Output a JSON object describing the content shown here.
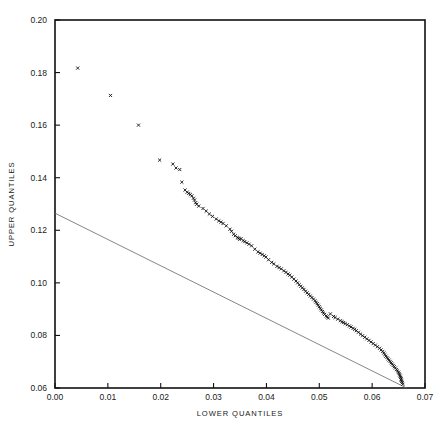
{
  "figure": {
    "background_color": "#ffffff",
    "width": 444,
    "height": 427
  },
  "chart_data": {
    "type": "scatter",
    "title": "",
    "subtitle": "",
    "xlabel": "LOWER QUANTILES",
    "ylabel": "UPPER QUANTILES",
    "xlim": [
      0.0,
      0.07
    ],
    "ylim": [
      0.06,
      0.2
    ],
    "xticks": [
      0.0,
      0.01,
      0.02,
      0.03,
      0.04,
      0.05,
      0.06,
      0.07
    ],
    "xtick_labels": [
      "0.00",
      "0.01",
      "0.02",
      "0.03",
      "0.04",
      "0.05",
      "0.06",
      "0.07"
    ],
    "yticks": [
      0.06,
      0.08,
      0.1,
      0.12,
      0.14,
      0.16,
      0.18,
      0.2
    ],
    "ytick_labels": [
      "0.06",
      "0.08",
      "0.10",
      "0.12",
      "0.14",
      "0.16",
      "0.18",
      "0.20"
    ],
    "grid": false,
    "legend": null,
    "marker_symbol": "x",
    "marker_color": "#111111",
    "marker_size": 3.1,
    "frame_color": "#111111",
    "reference_line": {
      "name": "reference-line",
      "color": "#666666",
      "x": [
        0.0,
        0.0665
      ],
      "y": [
        0.1265,
        0.06
      ]
    },
    "series": [
      {
        "name": "quantile-pairs",
        "points": [
          [
            0.0043,
            0.1817
          ],
          [
            0.0105,
            0.1713
          ],
          [
            0.0158,
            0.16
          ],
          [
            0.0198,
            0.1467
          ],
          [
            0.0223,
            0.1452
          ],
          [
            0.0229,
            0.1437
          ],
          [
            0.0236,
            0.1431
          ],
          [
            0.024,
            0.1383
          ],
          [
            0.0246,
            0.1353
          ],
          [
            0.025,
            0.1345
          ],
          [
            0.0253,
            0.134
          ],
          [
            0.0256,
            0.1336
          ],
          [
            0.0259,
            0.1331
          ],
          [
            0.0266,
            0.1305
          ],
          [
            0.028,
            0.1283
          ],
          [
            0.0292,
            0.1262
          ],
          [
            0.0305,
            0.1243
          ],
          [
            0.031,
            0.1236
          ],
          [
            0.0314,
            0.1231
          ],
          [
            0.0318,
            0.1226
          ],
          [
            0.0324,
            0.1217
          ],
          [
            0.0331,
            0.1204
          ],
          [
            0.0338,
            0.1185
          ],
          [
            0.0352,
            0.1168
          ],
          [
            0.0356,
            0.1161
          ],
          [
            0.0359,
            0.1157
          ],
          [
            0.0363,
            0.1152
          ],
          [
            0.0367,
            0.1147
          ],
          [
            0.0372,
            0.1141
          ],
          [
            0.0378,
            0.1128
          ],
          [
            0.0384,
            0.1118
          ],
          [
            0.0392,
            0.1108
          ],
          [
            0.0399,
            0.1098
          ],
          [
            0.0404,
            0.1088
          ],
          [
            0.041,
            0.1078
          ],
          [
            0.0414,
            0.1072
          ],
          [
            0.042,
            0.1063
          ],
          [
            0.0428,
            0.1053
          ],
          [
            0.0433,
            0.1046
          ],
          [
            0.0437,
            0.104
          ],
          [
            0.0441,
            0.1034
          ],
          [
            0.0444,
            0.1029
          ],
          [
            0.0448,
            0.1022
          ],
          [
            0.0452,
            0.1014
          ],
          [
            0.0456,
            0.1007
          ],
          [
            0.0459,
            0.1
          ],
          [
            0.0462,
            0.0993
          ],
          [
            0.0465,
            0.0987
          ],
          [
            0.0468,
            0.0981
          ],
          [
            0.0471,
            0.0975
          ],
          [
            0.0474,
            0.0968
          ],
          [
            0.0477,
            0.0962
          ],
          [
            0.048,
            0.0956
          ],
          [
            0.0483,
            0.095
          ],
          [
            0.0486,
            0.0944
          ],
          [
            0.0489,
            0.0938
          ],
          [
            0.0492,
            0.0932
          ],
          [
            0.0494,
            0.0926
          ],
          [
            0.0496,
            0.0921
          ],
          [
            0.0498,
            0.0915
          ],
          [
            0.05,
            0.0909
          ],
          [
            0.0502,
            0.0903
          ],
          [
            0.0504,
            0.0897
          ],
          [
            0.0506,
            0.0891
          ],
          [
            0.0508,
            0.0885
          ],
          [
            0.051,
            0.088
          ],
          [
            0.0513,
            0.0874
          ],
          [
            0.0521,
            0.0882
          ],
          [
            0.0535,
            0.0862
          ],
          [
            0.0546,
            0.0849
          ],
          [
            0.0549,
            0.0845
          ],
          [
            0.0553,
            0.0841
          ],
          [
            0.0557,
            0.0836
          ],
          [
            0.056,
            0.0832
          ],
          [
            0.0564,
            0.0827
          ],
          [
            0.0567,
            0.0823
          ],
          [
            0.057,
            0.0818
          ],
          [
            0.0574,
            0.0812
          ],
          [
            0.0578,
            0.0805
          ],
          [
            0.0582,
            0.0799
          ],
          [
            0.0586,
            0.0793
          ],
          [
            0.059,
            0.0787
          ],
          [
            0.0594,
            0.0781
          ],
          [
            0.0598,
            0.0775
          ],
          [
            0.0602,
            0.0769
          ],
          [
            0.0606,
            0.0763
          ],
          [
            0.061,
            0.0757
          ],
          [
            0.0614,
            0.0751
          ],
          [
            0.0617,
            0.0745
          ],
          [
            0.062,
            0.0739
          ],
          [
            0.0622,
            0.0733
          ],
          [
            0.0624,
            0.0727
          ],
          [
            0.0626,
            0.0721
          ],
          [
            0.0628,
            0.0716
          ],
          [
            0.063,
            0.0711
          ],
          [
            0.0632,
            0.0706
          ],
          [
            0.0634,
            0.0701
          ],
          [
            0.0636,
            0.0696
          ],
          [
            0.0638,
            0.0691
          ],
          [
            0.064,
            0.0686
          ],
          [
            0.0642,
            0.0681
          ],
          [
            0.0644,
            0.0676
          ],
          [
            0.0646,
            0.067
          ],
          [
            0.0648,
            0.0665
          ],
          [
            0.065,
            0.066
          ],
          [
            0.0651,
            0.0655
          ],
          [
            0.0652,
            0.065
          ],
          [
            0.0653,
            0.0645
          ],
          [
            0.0654,
            0.064
          ],
          [
            0.0655,
            0.0635
          ],
          [
            0.0655,
            0.063
          ],
          [
            0.0656,
            0.0625
          ],
          [
            0.0657,
            0.062
          ],
          [
            0.0658,
            0.0614
          ],
          [
            0.0345,
            0.1173
          ],
          [
            0.0347,
            0.117
          ],
          [
            0.0349,
            0.1166
          ],
          [
            0.0262,
            0.1322
          ],
          [
            0.0264,
            0.1315
          ],
          [
            0.0268,
            0.1299
          ],
          [
            0.0272,
            0.1292
          ],
          [
            0.0286,
            0.1273
          ],
          [
            0.0298,
            0.1253
          ],
          [
            0.0334,
            0.1196
          ],
          [
            0.0341,
            0.1179
          ],
          [
            0.0388,
            0.1113
          ],
          [
            0.0396,
            0.1103
          ],
          [
            0.0424,
            0.1058
          ],
          [
            0.0515,
            0.087
          ],
          [
            0.0517,
            0.0866
          ],
          [
            0.0527,
            0.0872
          ],
          [
            0.053,
            0.0868
          ],
          [
            0.054,
            0.0856
          ],
          [
            0.0543,
            0.0852
          ]
        ]
      }
    ]
  },
  "plot_geometry": {
    "left_px": 55,
    "right_px": 425,
    "top_px": 20,
    "bottom_px": 388
  }
}
